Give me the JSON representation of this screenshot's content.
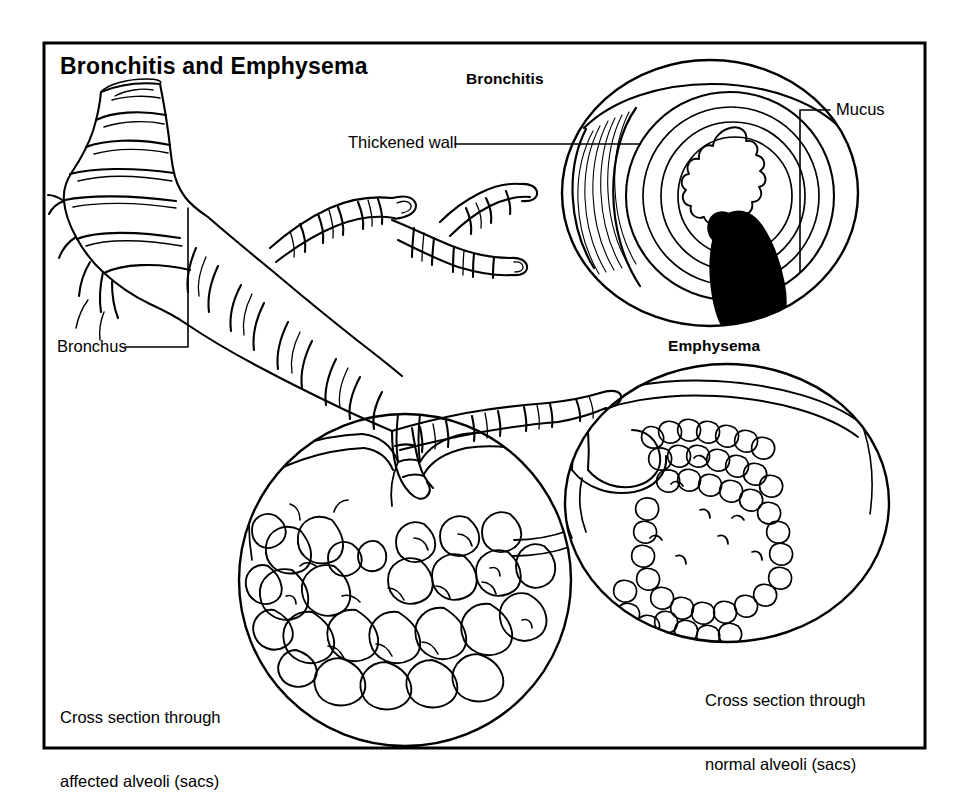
{
  "figure": {
    "title": "Bronchitis and Emphysema",
    "frame_color": "#000000",
    "background_color": "#ffffff",
    "ink_color": "#000000"
  },
  "headings": {
    "bronchitis": "Bronchitis",
    "emphysema": "Emphysema"
  },
  "labels": {
    "thickened_wall": "Thickened wall",
    "mucus": "Mucus",
    "bronchus": "Bronchus"
  },
  "captions": {
    "affected_line1": "Cross section through",
    "affected_line2": "affected alveoli (sacs)",
    "normal_line1": "Cross section through",
    "normal_line2": "normal alveoli (sacs)"
  },
  "icons": {
    "bronchial_tree": "bronchial-tree-icon",
    "bronchitis_inset": "bronchitis-cross-section-icon",
    "affected_alveoli_inset": "affected-alveoli-icon",
    "normal_alveoli_inset": "normal-alveoli-icon",
    "mucus_plug": "mucus-plug-icon"
  }
}
